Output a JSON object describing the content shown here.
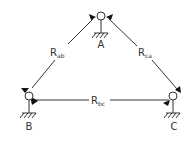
{
  "diagram": {
    "type": "triangle-network",
    "line_color": "#333333",
    "background": "#ffffff",
    "nodes": [
      {
        "id": "A",
        "label": "A",
        "x": 101,
        "y": 16
      },
      {
        "id": "B",
        "label": "B",
        "x": 29,
        "y": 96
      },
      {
        "id": "C",
        "label": "C",
        "x": 173,
        "y": 96
      }
    ],
    "edges": [
      {
        "from": "A",
        "to": "B",
        "label_main": "R",
        "label_sub": "ab"
      },
      {
        "from": "C",
        "to": "A",
        "label_main": "R",
        "label_sub": "ca"
      },
      {
        "from": "B",
        "to": "C",
        "label_main": "R",
        "label_sub": "bc"
      }
    ]
  }
}
